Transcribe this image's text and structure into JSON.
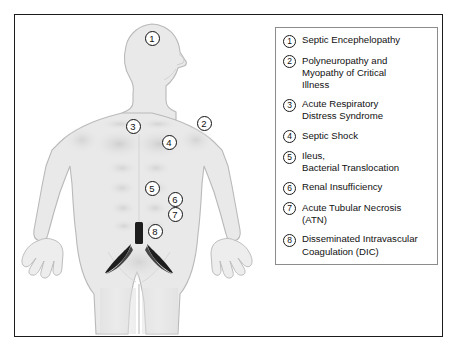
{
  "figure": {
    "background_color": "#ffffff",
    "frame_color": "#1b1b1b",
    "body_fill": "#e9e9e9",
    "body_stroke": "#b8b8b8",
    "vessel_color": "#1d1d1d"
  },
  "body_markers": [
    {
      "number": "1",
      "label": "Septic Encephelopathy",
      "x": 152,
      "y": 38,
      "style": "outline"
    },
    {
      "number": "2",
      "label": "Polyneuropathy and Myopathy of Critical Illness",
      "x": 204,
      "y": 123,
      "style": "outline"
    },
    {
      "number": "3",
      "label": "Acute Respiratory Distress Syndrome",
      "x": 133,
      "y": 126,
      "style": "outline"
    },
    {
      "number": "4",
      "label": "Septic Shock",
      "x": 169,
      "y": 142,
      "style": "outline"
    },
    {
      "number": "5",
      "label": "Ileus, Bacterial Translocation",
      "x": 152,
      "y": 188,
      "style": "outline"
    },
    {
      "number": "6",
      "label": "Renal Insufficiency",
      "x": 175,
      "y": 199,
      "style": "outline"
    },
    {
      "number": "7",
      "label": "Acute Tubular Necrosis (ATN)",
      "x": 175,
      "y": 214,
      "style": "outline"
    },
    {
      "number": "8",
      "label": "Disseminated Intravascular Coagulation (DIC)",
      "x": 155,
      "y": 231,
      "style": "outline"
    }
  ],
  "legend": {
    "items": [
      {
        "number": "1",
        "text": "Septic Encephelopathy"
      },
      {
        "number": "2",
        "text": "Polyneuropathy and\nMyopathy of Critical\nIllness"
      },
      {
        "number": "3",
        "text": "Acute Respiratory\nDistress Syndrome"
      },
      {
        "number": "4",
        "text": "Septic Shock"
      },
      {
        "number": "5",
        "text": "Ileus,\nBacterial Translocation"
      },
      {
        "number": "6",
        "text": "Renal Insufficiency"
      },
      {
        "number": "7",
        "text": "Acute Tubular Necrosis\n(ATN)"
      },
      {
        "number": "8",
        "text": "Disseminated Intravascular\nCoagulation (DIC)"
      }
    ]
  }
}
